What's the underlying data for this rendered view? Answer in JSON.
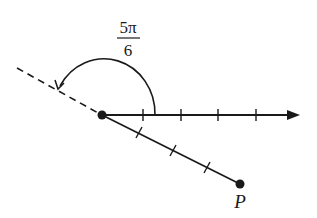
{
  "diagram": {
    "type": "angle-in-standard-position",
    "angle_label": {
      "numerator": "5π",
      "denominator": "6"
    },
    "point_label": "P",
    "initial_side_ticks": 4,
    "segment_ticks": 3,
    "colors": {
      "stroke": "#1a1a1a",
      "background": "#ffffff"
    }
  }
}
